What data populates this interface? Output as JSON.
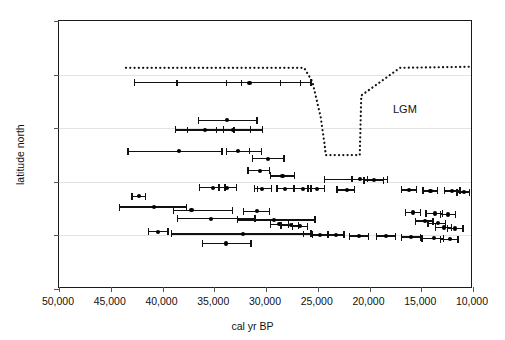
{
  "chart_data": {
    "type": "scatter",
    "title": "",
    "xlabel": "cal yr BP",
    "ylabel": "latitude north",
    "xlim": [
      50000,
      10000
    ],
    "ylim": [
      30,
      55
    ],
    "x_reversed": true,
    "xticks": [
      50000,
      45000,
      40000,
      35000,
      30000,
      25000,
      20000,
      15000,
      10000
    ],
    "xticklabels": [
      "50,000",
      "45,000",
      "40,000",
      "35,000",
      "30,000",
      "25,000",
      "20,000",
      "15,000",
      "10,000"
    ],
    "yticks": [
      30,
      35,
      40,
      45,
      50,
      55
    ],
    "yticklabels": [
      "30",
      "35",
      "40",
      "45",
      "50",
      "55"
    ],
    "gridlines_y": [
      35,
      40,
      45,
      50
    ],
    "grid": "horizontal-only",
    "legend": "none",
    "annotations": [
      {
        "text": "LGM",
        "x": 22600,
        "y": 47.6
      }
    ],
    "lgm_boundary": {
      "label": "LGM",
      "style": "dotted",
      "points": [
        {
          "x": 43500,
          "y": 50.6
        },
        {
          "x": 26200,
          "y": 50.6
        },
        {
          "x": 25400,
          "y": 49.3
        },
        {
          "x": 24600,
          "y": 46.0
        },
        {
          "x": 24200,
          "y": 43.3
        },
        {
          "x": 24100,
          "y": 42.4
        },
        {
          "x": 20800,
          "y": 42.4
        },
        {
          "x": 20700,
          "y": 46.2
        },
        {
          "x": 20650,
          "y": 48.0
        },
        {
          "x": 16900,
          "y": 50.6
        },
        {
          "x": 10100,
          "y": 50.7
        }
      ]
    },
    "series": [
      {
        "name": "radiocarbon dates with error ranges",
        "marker": "filled-circle",
        "errorbar": "horizontal",
        "points": [
          {
            "y": 49.3,
            "x": 31600,
            "xlo": 42800,
            "xhi": 25600,
            "ticks": [
              38600,
              33800,
              32400,
              28600,
              26700
            ]
          },
          {
            "y": 45.8,
            "x": 33800,
            "xlo": 36600,
            "xhi": 30800
          },
          {
            "y": 44.9,
            "x": 35900,
            "xlo": 38800,
            "xhi": 30300,
            "ticks": [
              37600,
              34800,
              33100,
              31500
            ]
          },
          {
            "y": 44.9,
            "x": 33200,
            "xlo": 34200,
            "xhi": 31400
          },
          {
            "y": 42.9,
            "x": 38400,
            "xlo": 43400,
            "xhi": 34200
          },
          {
            "y": 42.9,
            "x": 32700,
            "xlo": 33900,
            "xhi": 30400,
            "ticks": [
              31600
            ]
          },
          {
            "y": 42.2,
            "x": 29800,
            "xlo": 31400,
            "xhi": 28200
          },
          {
            "y": 41.1,
            "x": 30600,
            "xlo": 31800,
            "xhi": 29600
          },
          {
            "y": 40.6,
            "x": 28400,
            "xlo": 29600,
            "xhi": 27200
          },
          {
            "y": 40.3,
            "x": 20900,
            "xlo": 24400,
            "xhi": 18200,
            "ticks": [
              21700,
              20200
            ]
          },
          {
            "y": 40.2,
            "x": 19600,
            "xlo": 20600,
            "xhi": 18600
          },
          {
            "y": 39.5,
            "x": 35100,
            "xlo": 36500,
            "xhi": 33900
          },
          {
            "y": 39.5,
            "x": 33800,
            "xlo": 34600,
            "xhi": 32800
          },
          {
            "y": 39.4,
            "x": 30400,
            "xlo": 31200,
            "xhi": 29400,
            "ticks": [
              30800
            ]
          },
          {
            "y": 39.4,
            "x": 28200,
            "xlo": 29000,
            "xhi": 27200
          },
          {
            "y": 39.4,
            "x": 26400,
            "xlo": 27400,
            "xhi": 25600
          },
          {
            "y": 39.4,
            "x": 25100,
            "xlo": 26000,
            "xhi": 24300
          },
          {
            "y": 39.3,
            "x": 22200,
            "xlo": 23200,
            "xhi": 21400
          },
          {
            "y": 39.3,
            "x": 16200,
            "xlo": 17000,
            "xhi": 15400
          },
          {
            "y": 39.2,
            "x": 14100,
            "xlo": 14900,
            "xhi": 13400
          },
          {
            "y": 39.2,
            "x": 12000,
            "xlo": 12800,
            "xhi": 11200
          },
          {
            "y": 39.1,
            "x": 10900,
            "xlo": 11600,
            "xhi": 10300
          },
          {
            "y": 38.7,
            "x": 42300,
            "xlo": 43000,
            "xhi": 41600
          },
          {
            "y": 37.7,
            "x": 40800,
            "xlo": 44200,
            "xhi": 37600
          },
          {
            "y": 37.4,
            "x": 37200,
            "xlo": 39000,
            "xhi": 33200
          },
          {
            "y": 37.3,
            "x": 30900,
            "xlo": 32200,
            "xhi": 29600
          },
          {
            "y": 37.2,
            "x": 15800,
            "xlo": 16600,
            "xhi": 15000
          },
          {
            "y": 37.1,
            "x": 13700,
            "xlo": 14600,
            "xhi": 12900
          },
          {
            "y": 37.0,
            "x": 12400,
            "xlo": 13200,
            "xhi": 11600
          },
          {
            "y": 36.6,
            "x": 35300,
            "xlo": 38600,
            "xhi": 31000
          },
          {
            "y": 36.5,
            "x": 29200,
            "xlo": 32800,
            "xhi": 25200
          },
          {
            "y": 36.4,
            "x": 14600,
            "xlo": 15600,
            "xhi": 13800
          },
          {
            "y": 36.2,
            "x": 13400,
            "xlo": 14400,
            "xhi": 12600
          },
          {
            "y": 36.1,
            "x": 28700,
            "xlo": 29600,
            "xhi": 27800
          },
          {
            "y": 36.0,
            "x": 27600,
            "xlo": 28600,
            "xhi": 26800
          },
          {
            "y": 35.9,
            "x": 26700,
            "xlo": 27500,
            "xhi": 25900
          },
          {
            "y": 35.8,
            "x": 12800,
            "xlo": 13700,
            "xhi": 12000
          },
          {
            "y": 35.7,
            "x": 11700,
            "xlo": 12500,
            "xhi": 10900
          },
          {
            "y": 35.4,
            "x": 40400,
            "xlo": 41400,
            "xhi": 39400
          },
          {
            "y": 35.2,
            "x": 32200,
            "xlo": 39200,
            "xhi": 25600,
            "ticks": [
              26400
            ]
          },
          {
            "y": 35.1,
            "x": 24800,
            "xlo": 25600,
            "xhi": 24000
          },
          {
            "y": 35.1,
            "x": 23200,
            "xlo": 24000,
            "xhi": 22400
          },
          {
            "y": 35.0,
            "x": 21000,
            "xlo": 22000,
            "xhi": 20000
          },
          {
            "y": 35.0,
            "x": 18400,
            "xlo": 19400,
            "xhi": 17400
          },
          {
            "y": 34.9,
            "x": 16000,
            "xlo": 17000,
            "xhi": 15000
          },
          {
            "y": 34.8,
            "x": 13800,
            "xlo": 15000,
            "xhi": 12800
          },
          {
            "y": 34.7,
            "x": 12200,
            "xlo": 13200,
            "xhi": 11400
          },
          {
            "y": 34.3,
            "x": 33900,
            "xlo": 36200,
            "xhi": 31400
          }
        ]
      }
    ]
  },
  "axes": {
    "x_title": "cal yr BP",
    "y_title": "latitude north"
  }
}
